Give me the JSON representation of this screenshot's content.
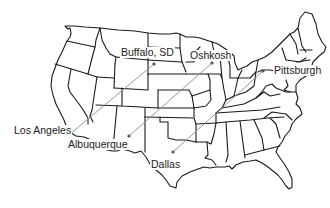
{
  "map": {
    "title": "",
    "region": "Contiguous United States",
    "line_color": "#8c8c8c",
    "border_color": "#1a1a1a",
    "dot_color": "#555555"
  },
  "cities": [
    {
      "name": "Buffalo, SD",
      "x": 154,
      "y": 64,
      "label_x": 120,
      "label_y": 47
    },
    {
      "name": "Oshkosh",
      "x": 212,
      "y": 63,
      "label_x": 189,
      "label_y": 50
    },
    {
      "name": "Pittsburgh",
      "x": 263,
      "y": 71,
      "label_x": 273,
      "label_y": 65
    },
    {
      "name": "Los Angeles",
      "x": 70,
      "y": 134,
      "label_x": 13,
      "label_y": 125
    },
    {
      "name": "Albuquerque",
      "x": 129,
      "y": 136,
      "label_x": 67,
      "label_y": 139
    },
    {
      "name": "Dallas",
      "x": 173,
      "y": 152,
      "label_x": 150,
      "label_y": 159
    }
  ],
  "routes": [
    {
      "from": "Los Angeles",
      "to": "Buffalo, SD"
    },
    {
      "from": "Albuquerque",
      "to": "Oshkosh"
    },
    {
      "from": "Dallas",
      "to": "Pittsburgh"
    }
  ],
  "labels": {
    "buffalo": "Buffalo, SD",
    "oshkosh": "Oshkosh",
    "pittsburgh": "Pittsburgh",
    "los_angeles": "Los Angeles",
    "albuquerque": "Albuquerque",
    "dallas": "Dallas"
  }
}
